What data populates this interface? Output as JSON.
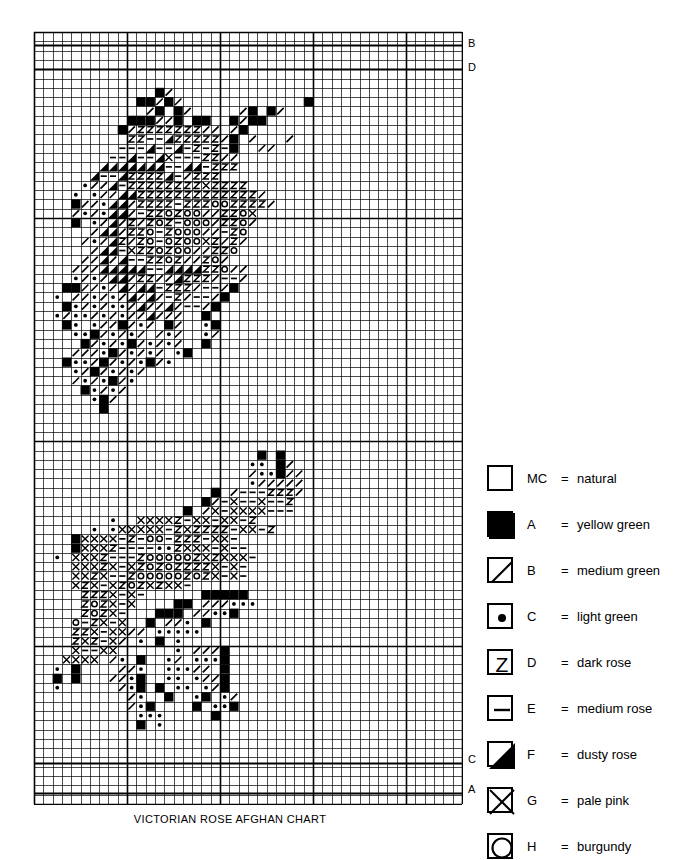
{
  "caption": "VICTORIAN ROSE AFGHAN CHART",
  "grid": {
    "cell": 9.3,
    "cols": 46,
    "rows": 83,
    "heavy_every": 10,
    "heavy_cols": [
      0,
      10,
      20,
      30,
      40,
      46
    ],
    "heavy_rows": [
      0,
      20,
      44,
      66,
      83
    ],
    "line_color": "#000000",
    "thin_width": 0.7,
    "heavy_width": 1.6
  },
  "edge_labels": [
    {
      "text": "B",
      "x": 468,
      "y": 44,
      "row": 2
    },
    {
      "text": "D",
      "x": 468,
      "y": 68,
      "row": 4
    },
    {
      "text": "C",
      "x": 468,
      "y": 760,
      "row": 78
    },
    {
      "text": "A",
      "x": 468,
      "y": 790,
      "row": 81
    }
  ],
  "guide_lines": [
    {
      "label": "B",
      "y": 44
    },
    {
      "label": "D",
      "y": 68
    },
    {
      "label": "C",
      "y": 762
    },
    {
      "label": "A",
      "y": 792
    }
  ],
  "legend": {
    "rows": [
      {
        "symbol": "blank",
        "code": "MC",
        "eq": "=",
        "name": "natural"
      },
      {
        "symbol": "solid",
        "code": "A",
        "eq": "=",
        "name": "yellow green"
      },
      {
        "symbol": "slash",
        "code": "B",
        "eq": "=",
        "name": "medium green"
      },
      {
        "symbol": "dot",
        "code": "C",
        "eq": "=",
        "name": "light green"
      },
      {
        "symbol": "zed",
        "code": "D",
        "eq": "=",
        "name": "dark rose"
      },
      {
        "symbol": "dash",
        "code": "E",
        "eq": "=",
        "name": "medium rose"
      },
      {
        "symbol": "triangle",
        "code": "F",
        "eq": "=",
        "name": "dusty rose"
      },
      {
        "symbol": "cross",
        "code": "G",
        "eq": "=",
        "name": "pale pink"
      },
      {
        "symbol": "circle",
        "code": "H",
        "eq": "=",
        "name": "burgundy"
      }
    ]
  },
  "symbol_key": {
    ".": "blank",
    "#": "solid",
    "/": "slash",
    "o": "dot",
    "Z": "zed",
    "-": "dash",
    "T": "triangle",
    "X": "cross",
    "O": "circle"
  },
  "chart_data": {
    "type": "heatmap",
    "title": "VICTORIAN ROSE AFGHAN CHART",
    "xlabel": "",
    "ylabel": "",
    "cols": 46,
    "rows": 83,
    "legend_codes": [
      "MC",
      "A",
      "B",
      "C",
      "D",
      "E",
      "F",
      "G",
      "H"
    ],
    "cells": [
      "..............................................",
      "..............................................",
      "..............................................",
      "..............................................",
      "..............................................",
      "..............................................",
      ".............#/...............................",
      "...........##/#/.............#................",
      "............/#.#/...../#.#/...................",
      "..........###//#.##..#/##.....................",
      ".........#/ZZZZZZZ//./#.......................",
      "..........ZZ--TZZZZZ/#./.../..................",
      ".........---T--T-Z-Z-#..//....................",
      "........--T--TX---ZZ//.......................",
      ".......TTTTTTT--TT-ZZZ........................",
      "......T--TZZZZT-/ZZZ..........................",
      ".....o//T-ZZZZZZZZXZZZZ.......................",
      "....o.o//TTZZZZZZZZZZZZZ/.....................",
      "....#//oTT/ZZZZ-ZZZOOZZZZ/....................",
      "..../o/oTT/-ZZOZOO//ZZOX......................",
      "....#.o/T/Z/ZOZ-OOO/ZZO/......................",
      "....../TT/ZZO-ZOOO//-ZO.......................",
      "...../o/TZ/ZO-OZOOXZ/Z/.......................",
      "....../TT-XZZOZOO//ZZO........................",
      ".....//T/T--ZZOZ//ZO/........................",
      "....///TTTTT--TTTTZZO//.......................",
      "....o/o/TT/ZZ//TZZZ/--/.......................",
      "...##//o/T/TT-ZZZ/--/#.......................",
      "..o.//o/o/T/T/-Z/--/#........................",
      "...#o/o/oo/T//T/--/#.........................",
      "..o/oo/o/o//T///..#..........................",
      "...#o.o//#/o/.#/..o#.........................",
      "....oo#/o/o/./o/..o/.........................",
      ".....#/o/o#/o/o/..#..........................",
      "....///o#/o/o/.o#............................",
      "...#oo/#/o/o#/o..............................",
      "....o/#/o/o/.................................",
      "..../o/o#/o..................................",
      ".....#o/o/...................................",
      "......o#/....................................",
      ".......#.....................................",
      "..............................................",
      "..............................................",
      "..............................................",
      "..............................................",
      "........................#.#...................",
      ".......................oo.#/..................",
      "......................./oo#//.................",
      ".......................o/////.................",
      "...................#./---ZZZ/.................",
      "..................#/-X--X--Z..................",
      "................#./X-XXXX---..................",
      "........o..XXXXZ-XX-XX-Z......................",
      "......o.oXXXXX-ZXZZZZ-XX-Z....................",
      "....#XXXX-Z-OO-ZZZ-XX-........................",
      "....#XXXZ----ooZXXX-X--.......................",
      "..o.XXXZ---ZOOOOOZXZXXX-......................",
      "....XXXZX-XZOZOZZZZX-X-.......................",
      "....XXZX--ZOOOOOZOZX-X-......................",
      "....XZX-XZOZXZXX-............................",
      ".....ZZZX-X-......#####.......................",
      ".....ZOZX-X....##.///ooo......................",
      ".....ZOZX-...###.//oo#........................",
      "....O-ZX-X..#.//o.#...........................",
      "....ZZX-XX//.ooooo............................",
      "....ZXZ-X/.o.#.o.............................",
      "....X--XX......o.///#.........................",
      "...XXXX./o.#..o/.ooo#.........................",
      "..o.#....//o..ooo//.#........................",
      "..#.#...//o#..oo.o//#........................",
      "..o....../o#.#.oo.o/#........................",
      "........../o..#..o#.o/.......................",
      "........../o#....#.oo#.......................",
      "...........ooo.....#.........................",
      "...........#.o...............................",
      "..............................................",
      "..............................................",
      "..............................................",
      "..............................................",
      "..............................................",
      "..............................................",
      "..............................................",
      ".............................................."
    ]
  }
}
